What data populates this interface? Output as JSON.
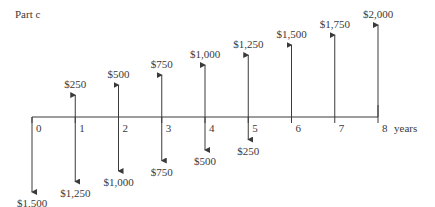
{
  "title": "Part c",
  "chart_data": {
    "type": "cash-flow-diagram",
    "title": "Part c",
    "xlabel": "years",
    "periods": [
      0,
      1,
      2,
      3,
      4,
      5,
      6,
      7,
      8
    ],
    "inflows": [
      {
        "period": 1,
        "value": 250,
        "label": "$250"
      },
      {
        "period": 2,
        "value": 500,
        "label": "$500"
      },
      {
        "period": 3,
        "value": 750,
        "label": "$750"
      },
      {
        "period": 4,
        "value": 1000,
        "label": "$1,000"
      },
      {
        "period": 5,
        "value": 1250,
        "label": "$1,250"
      },
      {
        "period": 6,
        "value": 1500,
        "label": "$1,500"
      },
      {
        "period": 7,
        "value": 1750,
        "label": "$1,750"
      },
      {
        "period": 8,
        "value": 2000,
        "label": "$2,000"
      }
    ],
    "outflows": [
      {
        "period": 0,
        "value": 1500,
        "label": "$1,500"
      },
      {
        "period": 1,
        "value": 1250,
        "label": "$1,250"
      },
      {
        "period": 2,
        "value": 1000,
        "label": "$1,000"
      },
      {
        "period": 3,
        "value": 750,
        "label": "$750"
      },
      {
        "period": 4,
        "value": 500,
        "label": "$500"
      },
      {
        "period": 5,
        "value": 250,
        "label": "$250"
      }
    ]
  }
}
